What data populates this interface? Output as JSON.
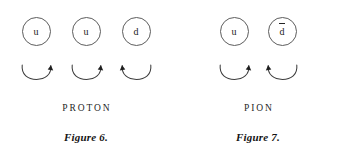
{
  "canvas": {
    "width": 344,
    "height": 160,
    "background_color": "#ffffff",
    "ink_color": "#1f1f1f",
    "circle_stroke_color": "#5d5d5d"
  },
  "figures": [
    {
      "id": "proton",
      "particle_name": "PROTON",
      "caption": "Figure 6.",
      "quarks": [
        {
          "symbol": "u",
          "is_antiquark": false,
          "spin_direction": "clockwise",
          "arrowhead_side": "right"
        },
        {
          "symbol": "u",
          "is_antiquark": false,
          "spin_direction": "clockwise",
          "arrowhead_side": "right"
        },
        {
          "symbol": "d",
          "is_antiquark": false,
          "spin_direction": "counterclockwise",
          "arrowhead_side": "left"
        }
      ]
    },
    {
      "id": "pion",
      "particle_name": "PION",
      "caption": "Figure 7.",
      "quarks": [
        {
          "symbol": "u",
          "is_antiquark": false,
          "spin_direction": "clockwise",
          "arrowhead_side": "right"
        },
        {
          "symbol": "d",
          "is_antiquark": true,
          "spin_direction": "counterclockwise",
          "arrowhead_side": "left"
        }
      ]
    }
  ]
}
